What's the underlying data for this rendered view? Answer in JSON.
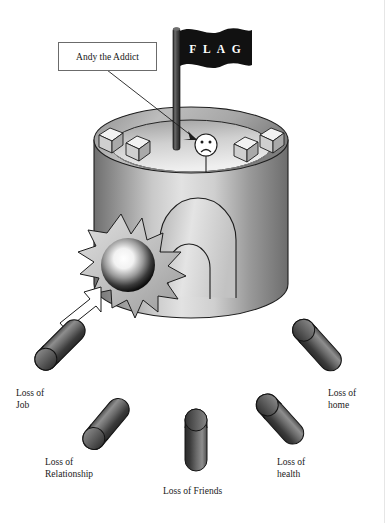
{
  "figure": {
    "background_color": "#ffffff",
    "ink_color": "#1a1a1a"
  },
  "callout": {
    "label": "Andy the Addict",
    "box": {
      "x": 58,
      "y": 42,
      "w": 97,
      "h": 27
    },
    "leader_from": {
      "x": 107,
      "y": 69
    },
    "leader_to": {
      "x": 203,
      "y": 140
    }
  },
  "flag": {
    "text": "F L A G",
    "fill": "#111111",
    "text_color": "#ffffff",
    "pole_color": "#4a4a4a"
  },
  "character": {
    "name": "andy-the-addict",
    "expression": "sad",
    "face_fill": "#ffffff",
    "outline": "#222222"
  },
  "drum": {
    "top_fill": "#b9b9b9",
    "body_light": "#dcdcdc",
    "body_dark": "#6f6f6f",
    "outline": "#1d1d1d",
    "cubes": [
      {
        "name": "cube-left-outer",
        "x": 99,
        "y": 130
      },
      {
        "name": "cube-left-inner",
        "x": 126,
        "y": 138
      },
      {
        "name": "cube-right-inner",
        "x": 237,
        "y": 139
      },
      {
        "name": "cube-right-outer",
        "x": 263,
        "y": 130
      }
    ],
    "arch_label": "doorway-arch"
  },
  "impact": {
    "name": "cannonball-impact",
    "burst_fill": "#c9c9c9",
    "ball_center_color": "#ffffff",
    "ball_edge_color": "#0d0d0d"
  },
  "capsules": [
    {
      "name": "capsule-loss-of-job",
      "label": "Loss of\nJob",
      "label_x": 16,
      "label_y": 388,
      "cx": 60,
      "cy": 345,
      "angle": -45,
      "length": 62,
      "width": 22,
      "has_arrow": true
    },
    {
      "name": "capsule-loss-of-relationship",
      "label": "Loss of\nRelationship",
      "label_x": 45,
      "label_y": 457,
      "cx": 106,
      "cy": 424,
      "angle": -50,
      "length": 60,
      "width": 22,
      "has_arrow": false
    },
    {
      "name": "capsule-loss-of-friends",
      "label": "Loss of Friends",
      "label_x": 163,
      "label_y": 486,
      "cx": 196,
      "cy": 440,
      "angle": 0,
      "length": 62,
      "width": 22,
      "has_arrow": false
    },
    {
      "name": "capsule-loss-of-health",
      "label": "Loss of\nhealth",
      "label_x": 277,
      "label_y": 457,
      "cx": 280,
      "cy": 419,
      "angle": 48,
      "length": 60,
      "width": 22,
      "has_arrow": false
    },
    {
      "name": "capsule-loss-of-home",
      "label": "Loss of\nhome",
      "label_x": 328,
      "label_y": 388,
      "cx": 317,
      "cy": 345,
      "angle": 48,
      "length": 62,
      "width": 22,
      "has_arrow": false
    }
  ],
  "capsule_style": {
    "light": "#8e8e8e",
    "mid": "#5d5d5d",
    "dark": "#303030",
    "outline": "#141414"
  },
  "arrow": {
    "name": "impact-arrow",
    "fill": "#ffffff",
    "outline": "#1a1a1a",
    "from": {
      "x": 48,
      "y": 330
    },
    "to": {
      "x": 100,
      "y": 288
    }
  }
}
